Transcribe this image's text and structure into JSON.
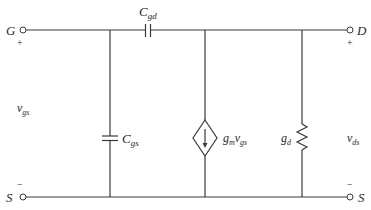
{
  "diagram": {
    "type": "circuit",
    "terminals": {
      "gate": {
        "label": "G",
        "polarity": "+"
      },
      "drain": {
        "label": "D",
        "polarity": "+"
      },
      "source_left": {
        "label": "S",
        "polarity": "−"
      },
      "source_right": {
        "label": "S",
        "polarity": "−"
      }
    },
    "components": {
      "cgd": {
        "type": "capacitor",
        "label_main": "C",
        "label_sub": "gd"
      },
      "cgs": {
        "type": "capacitor",
        "label_main": "C",
        "label_sub": "gs"
      },
      "current_source": {
        "type": "dependent-current-source",
        "label_main": "g",
        "label_sub1": "m",
        "label_mid": "v",
        "label_sub2": "gs",
        "direction": "down"
      },
      "gd": {
        "type": "resistor",
        "label_main": "g",
        "label_sub": "d"
      }
    },
    "voltages": {
      "vgs": {
        "label_main": "v",
        "label_sub": "gs"
      },
      "vds": {
        "label_main": "v",
        "label_sub": "ds"
      }
    },
    "colors": {
      "line": "#3a3a3a",
      "text": "#2a2a2a",
      "background": "#ffffff"
    }
  }
}
